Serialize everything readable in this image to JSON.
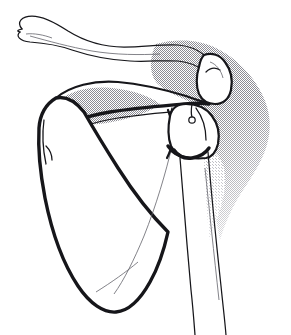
{
  "figure": {
    "title": "Anterior view of the right shoulder girdle",
    "style": "pen-and-ink line drawing with halftone stipple shading",
    "background_color": "#ffffff",
    "line_color": "#16161a",
    "faint_line_color": "#5a5a62",
    "stipple_color": "#8c8c94",
    "canvas": {
      "width": 291,
      "height": 335
    }
  },
  "structures": [
    {
      "id": "clavicle",
      "label": "Clavicle",
      "region": "superior-left",
      "description": "Long S-shaped bone sweeping from upper-left sternal end rightward to the acromial end"
    },
    {
      "id": "acromion",
      "label": "Acromion",
      "region": "superior-right",
      "description": "Flattened lateral projection of the scapular spine overhanging the humeral head"
    },
    {
      "id": "scapular-spine",
      "label": "Spine of scapula",
      "region": "upper-middle",
      "description": "Thick ridge crossing the scapula obliquely toward the acromion"
    },
    {
      "id": "supraspinatus-fossa",
      "label": "Supraspinatus fossa",
      "region": "upper-left",
      "description": "Shaded concave area above the scapular spine"
    },
    {
      "id": "scapula-body",
      "label": "Body of scapula",
      "region": "center-left",
      "description": "Large triangular blade with medial border, lateral border and inferior angle"
    },
    {
      "id": "inferior-angle",
      "label": "Inferior angle of scapula",
      "region": "lower-center",
      "description": "Rounded, heavily inked bottom tip of the scapular blade"
    },
    {
      "id": "glenoid",
      "label": "Glenoid cavity",
      "region": "center-right",
      "description": "Shallow articular socket receiving the humeral head"
    },
    {
      "id": "humeral-head",
      "label": "Head of humerus",
      "region": "center-right",
      "description": "Rounded proximal humerus seated against the glenoid"
    },
    {
      "id": "greater-tubercle",
      "label": "Greater tubercle",
      "region": "center-right",
      "description": "Bony prominence lateral to the humeral head"
    },
    {
      "id": "surgical-neck",
      "label": "Surgical neck of humerus",
      "region": "center-right",
      "description": "Narrowed zone below the tubercles"
    },
    {
      "id": "humeral-shaft",
      "label": "Shaft of humerus",
      "region": "right-lower",
      "description": "Two nearly vertical cortical lines descending to the lower edge of the frame"
    },
    {
      "id": "soft-tissue-shadow",
      "label": "Soft tissue shadow",
      "region": "right",
      "description": "Stippled halftone field behind the humeral head fading inferiorly"
    }
  ],
  "annotations": {
    "callouts": [],
    "labels_visible": false,
    "caption": ""
  }
}
